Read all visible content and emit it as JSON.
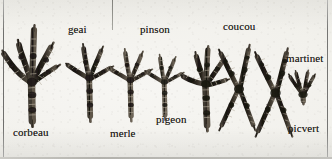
{
  "plate": {
    "title": "Pattes d'oiseaux",
    "medium": "scanned engraving / halftone print",
    "background_color": "#f2f1ec",
    "ink_color": "#1d1b18",
    "rule_color": "#757573",
    "width": 332,
    "height": 159
  },
  "rules": [
    {
      "name": "left-rule",
      "x": 3,
      "y": 0,
      "length": 159,
      "orientation": "vertical"
    },
    {
      "name": "mid-rule",
      "x": 112,
      "y": 0,
      "length": 30,
      "orientation": "vertical"
    },
    {
      "name": "right-rule",
      "x": 327,
      "y": 0,
      "length": 159,
      "orientation": "vertical"
    },
    {
      "name": "bottom-rule",
      "x": 0,
      "y": 157,
      "length": 332,
      "orientation": "horizontal"
    }
  ],
  "specimens": [
    {
      "id": "corbeau",
      "label": "corbeau",
      "label_x": 13,
      "label_y": 128,
      "foot_type": "anisodactyl",
      "toes_forward": 3,
      "toes_backward": 1,
      "size": "large",
      "foot_x": 2,
      "foot_y": 26,
      "foot_w": 58,
      "foot_h": 100
    },
    {
      "id": "geai",
      "label": "geai",
      "label_x": 68,
      "label_y": 25,
      "foot_type": "anisodactyl",
      "toes_forward": 3,
      "toes_backward": 1,
      "size": "medium",
      "foot_x": 68,
      "foot_y": 44,
      "foot_w": 44,
      "foot_h": 82
    },
    {
      "id": "merle",
      "label": "merle",
      "label_x": 110,
      "label_y": 129,
      "foot_type": "anisodactyl",
      "toes_forward": 3,
      "toes_backward": 1,
      "size": "medium",
      "foot_x": 110,
      "foot_y": 50,
      "foot_w": 42,
      "foot_h": 78
    },
    {
      "id": "pinson",
      "label": "pinson",
      "label_x": 140,
      "label_y": 25,
      "foot_type": "anisodactyl",
      "toes_forward": 3,
      "toes_backward": 1,
      "size": "small",
      "foot_x": 146,
      "foot_y": 54,
      "foot_w": 38,
      "foot_h": 72
    },
    {
      "id": "pigeon",
      "label": "pigeon",
      "label_x": 153,
      "label_y": 115,
      "foot_type": "anisodactyl",
      "toes_forward": 3,
      "toes_backward": 1,
      "size": "medium",
      "foot_x": 182,
      "foot_y": 48,
      "foot_w": 48,
      "foot_h": 86
    },
    {
      "id": "coucou",
      "label": "coucou",
      "label_x": 223,
      "label_y": 22,
      "foot_type": "zygodactyl",
      "toes_forward": 2,
      "toes_backward": 2,
      "size": "medium",
      "foot_x": 218,
      "foot_y": 42,
      "foot_w": 44,
      "foot_h": 96
    },
    {
      "id": "picvert",
      "label": "picvert",
      "label_x": 288,
      "label_y": 124,
      "foot_type": "zygodactyl",
      "toes_forward": 2,
      "toes_backward": 2,
      "size": "medium",
      "foot_x": 252,
      "foot_y": 44,
      "foot_w": 46,
      "foot_h": 98
    },
    {
      "id": "martinet",
      "label": "martinet",
      "label_x": 286,
      "label_y": 54,
      "foot_type": "pamprodactyl",
      "toes_forward": 4,
      "toes_backward": 0,
      "size": "very small",
      "foot_x": 286,
      "foot_y": 70,
      "foot_w": 32,
      "foot_h": 34
    }
  ]
}
